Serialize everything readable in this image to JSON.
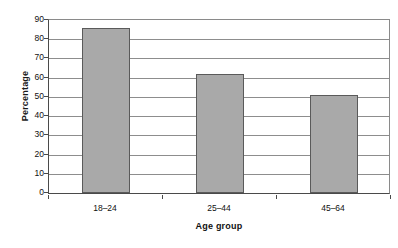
{
  "chart_data": {
    "type": "bar",
    "title": "",
    "subtitle": "",
    "xlabel": "Age group",
    "ylabel": "Percentage",
    "categories": [
      "18–24",
      "25–44",
      "45–64"
    ],
    "values": [
      86,
      62,
      51
    ],
    "series": [
      {
        "name": "Percentage",
        "values": [
          86,
          62,
          51
        ]
      }
    ],
    "ylim": [
      0,
      90
    ],
    "ytick_labels": [
      "90",
      "80",
      "70",
      "60",
      "50",
      "40",
      "30",
      "20",
      "10",
      "0"
    ],
    "ytick_values": [
      90,
      80,
      70,
      60,
      50,
      40,
      30,
      20,
      10,
      0
    ],
    "ytick_step": 10,
    "grid": "horizontal",
    "legend": "none",
    "bar_color": "#a9a9a9",
    "bar_border_color": "#5a5a5a",
    "gridline_color": "#8d8d8d",
    "axis_color": "#4a4a4a",
    "background": "#ffffff"
  }
}
